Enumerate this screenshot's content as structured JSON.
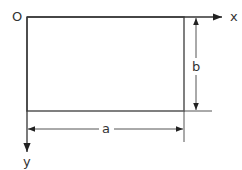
{
  "diagram": {
    "type": "rectangle-dimension-drawing",
    "labels": {
      "origin": "O",
      "x_axis": "x",
      "y_axis": "y",
      "width": "a",
      "height": "b"
    },
    "colors": {
      "line": "#555555",
      "text": "#333333",
      "background": "#ffffff"
    },
    "geometry": {
      "origin": [
        27,
        17
      ],
      "rect": {
        "x": 27,
        "y": 17,
        "width": 157,
        "height": 94
      },
      "x_axis_end": [
        224,
        17
      ],
      "y_axis_end": [
        27,
        152
      ],
      "dim_a_y": 129,
      "dim_b_x": 196
    }
  }
}
